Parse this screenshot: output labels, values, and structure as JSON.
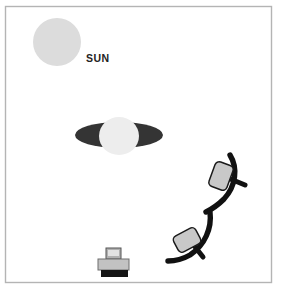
{
  "diagram": {
    "background_color": "#ffffff",
    "frame": {
      "name": "outer-frame",
      "border_color": "#b4b4b4",
      "x": 5,
      "y": 6,
      "width": 267,
      "height": 277
    },
    "objects": [
      {
        "id": "sun",
        "label": "SUN",
        "type": "circle",
        "color": "#dcdcdc",
        "cx": 57,
        "cy": 42,
        "r": 24,
        "label_x": 86,
        "label_y": 62
      },
      {
        "id": "ringed-planet",
        "label": "",
        "type": "ringed-planet",
        "ring_color": "#343434",
        "body_color": "#ededed",
        "cx": 119,
        "cy": 135,
        "ring_rx": 44,
        "ring_ry": 13,
        "body_rx": 20,
        "body_ry": 19
      },
      {
        "id": "comet-upper",
        "type": "arc-with-panel",
        "stroke_color": "#111111",
        "panel_color": "#c8c8c8"
      },
      {
        "id": "comet-lower",
        "type": "arc-with-panel",
        "stroke_color": "#111111",
        "panel_color": "#c8c8c8"
      },
      {
        "id": "lander",
        "type": "device",
        "body_color": "#c2c2c2",
        "base_color": "#151515",
        "cx": 114,
        "cy": 263
      }
    ]
  }
}
